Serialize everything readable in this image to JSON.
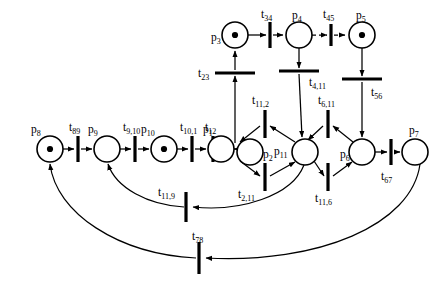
{
  "diagram": {
    "type": "petri-net",
    "title": "",
    "places": [
      {
        "id": "p8",
        "label": "p",
        "sub": "8",
        "cx": 50,
        "cy": 149,
        "r": 13,
        "tokens": 1,
        "label_x": 31,
        "label_y": 130
      },
      {
        "id": "p9",
        "label": "p",
        "sub": "9",
        "cx": 107,
        "cy": 149,
        "r": 13,
        "tokens": 0,
        "label_x": 88,
        "label_y": 130
      },
      {
        "id": "p10",
        "label": "p",
        "sub": "10",
        "cx": 164,
        "cy": 149,
        "r": 13,
        "tokens": 1,
        "label_x": 141,
        "label_y": 130
      },
      {
        "id": "p1",
        "label": "p",
        "sub": "1",
        "cx": 221,
        "cy": 149,
        "r": 13,
        "tokens": 0,
        "label_x": 203,
        "label_y": 130
      },
      {
        "id": "p2",
        "label": "p",
        "sub": "2",
        "cx": 250,
        "cy": 152,
        "r": 13,
        "tokens": 0,
        "label_x": 263,
        "label_y": 158
      },
      {
        "id": "p11",
        "label": "p",
        "sub": "11",
        "cx": 305,
        "cy": 152,
        "r": 13,
        "tokens": 0,
        "label_x": 276,
        "label_y": 152
      },
      {
        "id": "p6",
        "label": "p",
        "sub": "6",
        "cx": 362,
        "cy": 152,
        "r": 13,
        "tokens": 0,
        "label_x": 342,
        "label_y": 158
      },
      {
        "id": "p7",
        "label": "p",
        "sub": "7",
        "cx": 415,
        "cy": 152,
        "r": 13,
        "tokens": 0,
        "label_x": 411,
        "label_y": 132
      },
      {
        "id": "p3",
        "label": "p",
        "sub": "3",
        "cx": 235,
        "cy": 35,
        "r": 13,
        "tokens": 1,
        "label_x": 215,
        "label_y": 41
      },
      {
        "id": "p4",
        "label": "p",
        "sub": "4",
        "cx": 299,
        "cy": 35,
        "r": 13,
        "tokens": 0,
        "label_x": 292,
        "label_y": 17
      },
      {
        "id": "p5",
        "label": "p",
        "sub": "5",
        "cx": 362,
        "cy": 35,
        "r": 13,
        "tokens": 1,
        "label_x": 358,
        "label_y": 17
      }
    ],
    "transitions": [
      {
        "id": "t89",
        "label": "t",
        "sub": "89",
        "x": 78,
        "y": 149,
        "orient": "v",
        "len": 26,
        "label_x": 69,
        "label_y": 128
      },
      {
        "id": "t9_10",
        "label": "t",
        "sub": "9,10",
        "x": 135,
        "y": 149,
        "orient": "v",
        "len": 26,
        "label_x": 123,
        "label_y": 128
      },
      {
        "id": "t10_1",
        "label": "t",
        "sub": "10,1",
        "x": 192,
        "y": 149,
        "orient": "v",
        "len": 26,
        "label_x": 180,
        "label_y": 128
      },
      {
        "id": "t12",
        "label": "t",
        "sub": "12",
        "x": 213,
        "y": 149,
        "orient": "v",
        "len": 26,
        "label_x": 205,
        "label_y": 128
      },
      {
        "id": "t34",
        "label": "t",
        "sub": "34",
        "x": 270,
        "y": 35,
        "orient": "v",
        "len": 26,
        "label_x": 261,
        "label_y": 16
      },
      {
        "id": "t45",
        "label": "t",
        "sub": "45",
        "x": 331,
        "y": 35,
        "orient": "v",
        "len": 22,
        "label_x": 324,
        "label_y": 16
      },
      {
        "id": "t23",
        "label": "t",
        "sub": "23",
        "x": 235,
        "y": 72,
        "orient": "h",
        "len": 40,
        "label_x": 200,
        "label_y": 77
      },
      {
        "id": "t4_11",
        "label": "t",
        "sub": "4,11",
        "x": 299,
        "y": 72,
        "orient": "h",
        "len": 40,
        "label_x": 311,
        "label_y": 85
      },
      {
        "id": "t56",
        "label": "t",
        "sub": "56",
        "x": 362,
        "y": 80,
        "orient": "h",
        "len": 40,
        "label_x": 372,
        "label_y": 95
      },
      {
        "id": "t11_2",
        "label": "t",
        "sub": "11,2",
        "x": 265,
        "y": 124,
        "orient": "v",
        "len": 28,
        "label_x": 254,
        "label_y": 102
      },
      {
        "id": "t6_11",
        "label": "t",
        "sub": "6,11",
        "x": 328,
        "y": 124,
        "orient": "v",
        "len": 28,
        "label_x": 320,
        "label_y": 102
      },
      {
        "id": "t2_11",
        "label": "t",
        "sub": "2,11",
        "x": 265,
        "y": 177,
        "orient": "v",
        "len": 28,
        "label_x": 240,
        "label_y": 196
      },
      {
        "id": "t11_6",
        "label": "t",
        "sub": "11,6",
        "x": 328,
        "y": 177,
        "orient": "v",
        "len": 28,
        "label_x": 317,
        "label_y": 200
      },
      {
        "id": "t67",
        "label": "t",
        "sub": "67",
        "x": 391,
        "y": 152,
        "orient": "v",
        "len": 26,
        "label_x": 383,
        "label_y": 178
      },
      {
        "id": "t11_9",
        "label": "t",
        "sub": "11,9",
        "x": 186,
        "y": 207,
        "orient": "v",
        "len": 30,
        "label_x": 161,
        "label_y": 196
      },
      {
        "id": "t78",
        "label": "t",
        "sub": "78",
        "x": 199,
        "y": 258,
        "orient": "v",
        "len": 32,
        "label_x": 194,
        "label_y": 238
      }
    ],
    "arcs": [
      {
        "from": "p8",
        "to": "t89",
        "style": "solid"
      },
      {
        "from": "t89",
        "to": "p9",
        "style": "solid"
      },
      {
        "from": "p9",
        "to": "t9_10",
        "style": "solid"
      },
      {
        "from": "t9_10",
        "to": "p10",
        "style": "solid"
      },
      {
        "from": "p10",
        "to": "t10_1",
        "style": "solid"
      },
      {
        "from": "t10_1",
        "to": "p1",
        "style": "solid"
      },
      {
        "from": "p1",
        "to": "t12",
        "style": "solid"
      },
      {
        "from": "t12",
        "to": "p2",
        "style": "solid"
      },
      {
        "from": "p3",
        "to": "t34",
        "style": "solid"
      },
      {
        "from": "t34",
        "to": "p4",
        "style": "solid"
      },
      {
        "from": "p4",
        "to": "t45",
        "style": "dashed"
      },
      {
        "from": "t45",
        "to": "p5",
        "style": "dashed"
      },
      {
        "from": "p2",
        "to": "t23",
        "style": "solid"
      },
      {
        "from": "t23",
        "to": "p3",
        "style": "solid"
      },
      {
        "from": "p4",
        "to": "t4_11",
        "style": "solid"
      },
      {
        "from": "t4_11",
        "to": "p11",
        "style": "solid"
      },
      {
        "from": "p5",
        "to": "t56",
        "style": "solid"
      },
      {
        "from": "t56",
        "to": "p6",
        "style": "solid"
      },
      {
        "from": "p11",
        "to": "t11_2",
        "style": "solid"
      },
      {
        "from": "t11_2",
        "to": "p2",
        "style": "solid"
      },
      {
        "from": "p2",
        "to": "t2_11",
        "style": "solid"
      },
      {
        "from": "t2_11",
        "to": "p11",
        "style": "solid"
      },
      {
        "from": "p6",
        "to": "t6_11",
        "style": "solid"
      },
      {
        "from": "t6_11",
        "to": "p11",
        "style": "solid"
      },
      {
        "from": "p11",
        "to": "t11_6",
        "style": "solid"
      },
      {
        "from": "t11_6",
        "to": "p6",
        "style": "solid"
      },
      {
        "from": "p6",
        "to": "t67",
        "style": "solid"
      },
      {
        "from": "t67",
        "to": "p7",
        "style": "solid"
      },
      {
        "from": "p11",
        "to": "t11_9",
        "style": "solid"
      },
      {
        "from": "t11_9",
        "to": "p9",
        "style": "solid"
      },
      {
        "from": "p7",
        "to": "t78",
        "style": "solid"
      },
      {
        "from": "t78",
        "to": "p8",
        "style": "solid"
      }
    ]
  }
}
